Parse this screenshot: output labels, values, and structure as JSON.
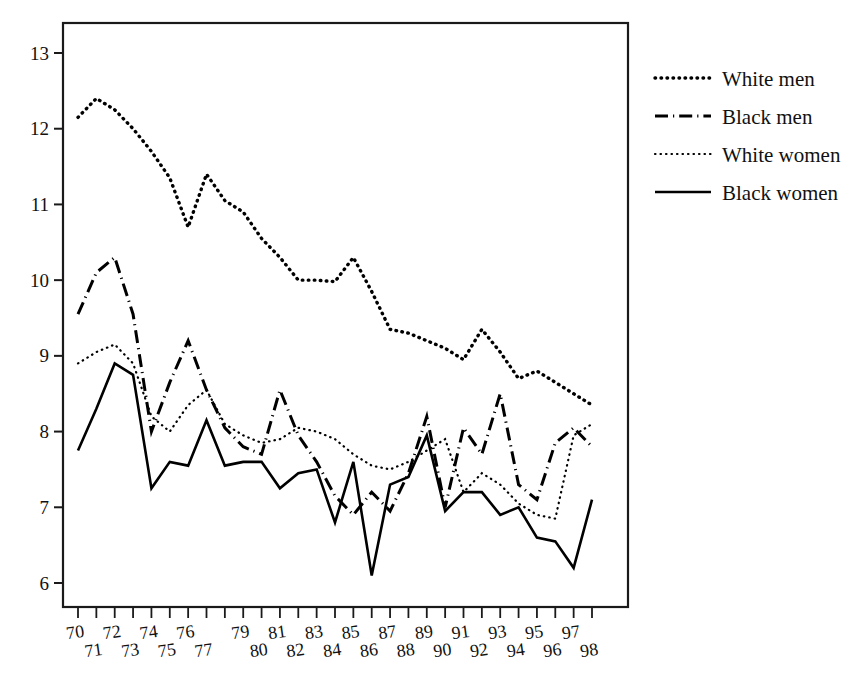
{
  "chart_data": {
    "type": "line",
    "title": "",
    "subtitle": "",
    "xlabel": "",
    "ylabel": "",
    "xlim": [
      70,
      98
    ],
    "ylim": [
      6,
      13
    ],
    "grid": false,
    "legend_position": "right",
    "x": [
      70,
      71,
      72,
      73,
      74,
      75,
      76,
      77,
      78,
      79,
      80,
      81,
      82,
      83,
      84,
      85,
      86,
      87,
      88,
      89,
      90,
      91,
      92,
      93,
      94,
      95,
      96,
      97,
      98
    ],
    "xtick_labels_top": [
      "70",
      "72",
      "74",
      "76",
      "79",
      "81",
      "83",
      "85",
      "87",
      "89",
      "91",
      "93",
      "95",
      "97"
    ],
    "xtick_labels_bottom": [
      "71",
      "73",
      "75",
      "77",
      "80",
      "82",
      "84",
      "86",
      "88",
      "90",
      "92",
      "94",
      "96",
      "98"
    ],
    "xtick_labels_all": [
      "70",
      "71",
      "72",
      "73",
      "74",
      "75",
      "76",
      "77",
      "79",
      "80",
      "81",
      "82",
      "83",
      "84",
      "85",
      "86",
      "87",
      "88",
      "89",
      "90",
      "91",
      "92",
      "93",
      "94",
      "95",
      "96",
      "97",
      "98"
    ],
    "ytick_labels": [
      "13",
      "12",
      "11",
      "10",
      "9",
      "8",
      "7",
      "6"
    ],
    "ytick_values": [
      13,
      12,
      11,
      10,
      9,
      8,
      7,
      6
    ],
    "series": [
      {
        "name": "White men",
        "style": "coarse-dotted",
        "values": [
          12.15,
          12.4,
          12.25,
          12.0,
          11.7,
          11.35,
          10.7,
          11.4,
          11.05,
          10.9,
          10.55,
          10.3,
          10.0,
          10.0,
          9.98,
          10.3,
          9.85,
          9.35,
          9.3,
          9.2,
          9.1,
          8.95,
          9.35,
          9.05,
          8.7,
          8.8,
          8.65,
          8.5,
          8.35
        ]
      },
      {
        "name": "Black men",
        "style": "dash-dot",
        "values": [
          9.55,
          10.1,
          10.3,
          9.55,
          8.0,
          8.65,
          9.2,
          8.55,
          8.05,
          7.8,
          7.7,
          8.55,
          7.95,
          7.6,
          7.15,
          6.9,
          7.2,
          6.95,
          7.45,
          8.2,
          7.0,
          8.05,
          7.7,
          8.5,
          7.3,
          7.1,
          7.85,
          8.05,
          7.8
        ]
      },
      {
        "name": "White women",
        "style": "fine-dotted",
        "values": [
          8.9,
          9.05,
          9.15,
          8.9,
          8.2,
          8.0,
          8.35,
          8.55,
          8.1,
          7.95,
          7.85,
          7.9,
          8.05,
          8.0,
          7.9,
          7.7,
          7.55,
          7.5,
          7.6,
          7.75,
          7.9,
          7.2,
          7.45,
          7.3,
          7.05,
          6.9,
          6.85,
          7.95,
          8.1
        ]
      },
      {
        "name": "Black women",
        "style": "solid",
        "values": [
          7.75,
          8.3,
          8.9,
          8.75,
          7.25,
          7.6,
          7.55,
          8.15,
          7.55,
          7.6,
          7.6,
          7.25,
          7.45,
          7.5,
          6.8,
          7.6,
          6.1,
          7.3,
          7.4,
          7.95,
          6.95,
          7.2,
          7.2,
          6.9,
          7.0,
          6.6,
          6.55,
          6.2,
          7.1
        ]
      }
    ]
  },
  "legend": {
    "items": [
      {
        "label": "White men",
        "style": "coarse-dotted"
      },
      {
        "label": "Black men",
        "style": "dash-dot"
      },
      {
        "label": "White women",
        "style": "fine-dotted"
      },
      {
        "label": "Black women",
        "style": "solid"
      }
    ]
  },
  "colors": {
    "line": "#000000",
    "axis": "#1a1a1a",
    "background": "#ffffff"
  }
}
